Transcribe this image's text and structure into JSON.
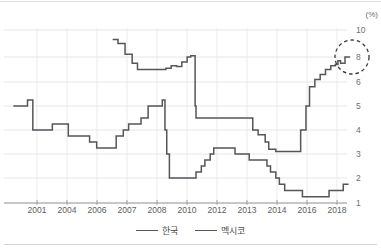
{
  "axes": {
    "unit_label": "(%)",
    "y_ticks": [
      {
        "label": "10",
        "value": 10,
        "y": 30
      },
      {
        "label": "8",
        "value": 8,
        "y": 57
      },
      {
        "label": "6",
        "value": 6,
        "y": 82
      },
      {
        "label": "5",
        "value": 5,
        "y": 106
      },
      {
        "label": "4",
        "value": 4,
        "y": 130
      },
      {
        "label": "3",
        "value": 3,
        "y": 154
      },
      {
        "label": "2",
        "value": 2,
        "y": 178
      },
      {
        "label": "1",
        "value": 1,
        "y": 203
      }
    ],
    "x_ticks": [
      {
        "label": "2001",
        "x": 37
      },
      {
        "label": "2004",
        "x": 67
      },
      {
        "label": "2006",
        "x": 97
      },
      {
        "label": "2007",
        "x": 127
      },
      {
        "label": "2008",
        "x": 157
      },
      {
        "label": "2010",
        "x": 187
      },
      {
        "label": "2012",
        "x": 217
      },
      {
        "label": "2013",
        "x": 247
      },
      {
        "label": "2014",
        "x": 277
      },
      {
        "label": "2016",
        "x": 307
      },
      {
        "label": "2018",
        "x": 337
      }
    ],
    "grid": "on",
    "y_axis_position": "right",
    "x_axis_line_y": 203
  },
  "legend": {
    "position": "bottom-center",
    "items": [
      {
        "label": "한국",
        "color": "#54565a"
      },
      {
        "label": "멕시코",
        "color": "#54565a"
      }
    ]
  },
  "annotation": {
    "type": "dashed-circle",
    "cx": 352,
    "cy": 57,
    "r": 17,
    "target_value": 8.0,
    "target_series": "멕시코"
  },
  "chart_data": {
    "type": "line",
    "title": "",
    "subtitle": "",
    "xlabel": "",
    "ylabel": "(%)",
    "ylim": [
      1,
      10
    ],
    "xlim": [
      2000,
      2019
    ],
    "grid": "on",
    "legend_position": "bottom-center",
    "note": "Policy interest rates, step (piecewise-constant) lines. Y-axis spacing is non-linear above 6.",
    "categories": [
      "2001",
      "2004",
      "2006",
      "2007",
      "2008",
      "2010",
      "2012",
      "2013",
      "2014",
      "2016",
      "2018"
    ],
    "series": [
      {
        "name": "한국",
        "color": "#54565a",
        "points": [
          {
            "x": 2000.3,
            "y": 5.0
          },
          {
            "x": 2001.0,
            "y": 5.0
          },
          {
            "x": 2001.1,
            "y": 5.25
          },
          {
            "x": 2001.3,
            "y": 5.25
          },
          {
            "x": 2001.4,
            "y": 4.0
          },
          {
            "x": 2002.3,
            "y": 4.0
          },
          {
            "x": 2002.5,
            "y": 4.25
          },
          {
            "x": 2003.2,
            "y": 4.25
          },
          {
            "x": 2003.4,
            "y": 3.75
          },
          {
            "x": 2004.3,
            "y": 3.75
          },
          {
            "x": 2004.6,
            "y": 3.5
          },
          {
            "x": 2005.0,
            "y": 3.25
          },
          {
            "x": 2005.9,
            "y": 3.25
          },
          {
            "x": 2006.1,
            "y": 3.75
          },
          {
            "x": 2006.5,
            "y": 4.0
          },
          {
            "x": 2006.8,
            "y": 4.25
          },
          {
            "x": 2007.5,
            "y": 4.5
          },
          {
            "x": 2007.9,
            "y": 5.0
          },
          {
            "x": 2008.7,
            "y": 5.25
          },
          {
            "x": 2008.85,
            "y": 4.0
          },
          {
            "x": 2008.95,
            "y": 3.0
          },
          {
            "x": 2009.1,
            "y": 2.0
          },
          {
            "x": 2010.4,
            "y": 2.0
          },
          {
            "x": 2010.6,
            "y": 2.25
          },
          {
            "x": 2010.9,
            "y": 2.5
          },
          {
            "x": 2011.1,
            "y": 2.75
          },
          {
            "x": 2011.4,
            "y": 3.0
          },
          {
            "x": 2011.6,
            "y": 3.25
          },
          {
            "x": 2012.5,
            "y": 3.25
          },
          {
            "x": 2012.8,
            "y": 3.0
          },
          {
            "x": 2013.4,
            "y": 3.0
          },
          {
            "x": 2013.6,
            "y": 2.75
          },
          {
            "x": 2014.4,
            "y": 2.75
          },
          {
            "x": 2014.6,
            "y": 2.5
          },
          {
            "x": 2014.8,
            "y": 2.25
          },
          {
            "x": 2015.1,
            "y": 2.0
          },
          {
            "x": 2015.3,
            "y": 1.75
          },
          {
            "x": 2015.6,
            "y": 1.5
          },
          {
            "x": 2016.4,
            "y": 1.5
          },
          {
            "x": 2016.6,
            "y": 1.25
          },
          {
            "x": 2017.9,
            "y": 1.25
          },
          {
            "x": 2018.1,
            "y": 1.5
          },
          {
            "x": 2018.9,
            "y": 1.75
          },
          {
            "x": 2019.2,
            "y": 1.75
          }
        ]
      },
      {
        "name": "멕시코",
        "color": "#54565a",
        "points": [
          {
            "x": 2005.9,
            "y": 9.3
          },
          {
            "x": 2006.2,
            "y": 9.0
          },
          {
            "x": 2006.6,
            "y": 8.2
          },
          {
            "x": 2007.0,
            "y": 7.5
          },
          {
            "x": 2007.3,
            "y": 7.0
          },
          {
            "x": 2008.6,
            "y": 7.0
          },
          {
            "x": 2008.9,
            "y": 7.1
          },
          {
            "x": 2009.2,
            "y": 7.3
          },
          {
            "x": 2009.5,
            "y": 7.25
          },
          {
            "x": 2009.8,
            "y": 7.6
          },
          {
            "x": 2010.1,
            "y": 8.0
          },
          {
            "x": 2010.3,
            "y": 8.1
          },
          {
            "x": 2010.55,
            "y": 5.0
          },
          {
            "x": 2010.6,
            "y": 4.5
          },
          {
            "x": 2013.6,
            "y": 4.5
          },
          {
            "x": 2013.8,
            "y": 4.0
          },
          {
            "x": 2014.1,
            "y": 3.8
          },
          {
            "x": 2014.5,
            "y": 3.5
          },
          {
            "x": 2014.7,
            "y": 3.2
          },
          {
            "x": 2015.1,
            "y": 3.1
          },
          {
            "x": 2016.3,
            "y": 3.1
          },
          {
            "x": 2016.5,
            "y": 4.0
          },
          {
            "x": 2016.8,
            "y": 5.0
          },
          {
            "x": 2017.0,
            "y": 5.8
          },
          {
            "x": 2017.3,
            "y": 6.2
          },
          {
            "x": 2017.6,
            "y": 6.6
          },
          {
            "x": 2017.9,
            "y": 7.0
          },
          {
            "x": 2018.2,
            "y": 7.3
          },
          {
            "x": 2018.45,
            "y": 7.4
          },
          {
            "x": 2018.6,
            "y": 7.7
          },
          {
            "x": 2018.75,
            "y": 7.5
          },
          {
            "x": 2019.0,
            "y": 8.0
          },
          {
            "x": 2019.25,
            "y": 8.05
          }
        ]
      }
    ]
  }
}
